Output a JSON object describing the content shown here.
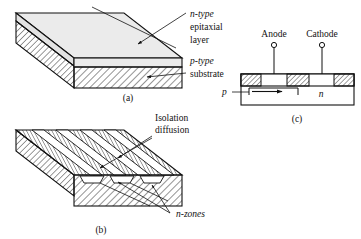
{
  "figure": {
    "title": "",
    "panels": [
      {
        "id": "a",
        "label": "(a)",
        "labels": {
          "epitaxial_line1": "n-type",
          "epitaxial_line2": "epitaxial",
          "epitaxial_line3": "layer",
          "substrate_line1": "p-type",
          "substrate_line2": "substrate"
        }
      },
      {
        "id": "b",
        "label": "(b)",
        "labels": {
          "isolation_line1": "Isolation",
          "isolation_line2": "diffusion",
          "nzones": "n-zones"
        }
      },
      {
        "id": "c",
        "label": "(c)",
        "labels": {
          "anode": "Anode",
          "cathode": "Cathode",
          "p_region": "p",
          "n_region": "n"
        }
      }
    ]
  },
  "colors": {
    "ink": "#111111",
    "paper": "#ffffff",
    "epi_face": "#e3e3e3",
    "epi_top": "#ebebeb",
    "hatch": "#111111"
  }
}
